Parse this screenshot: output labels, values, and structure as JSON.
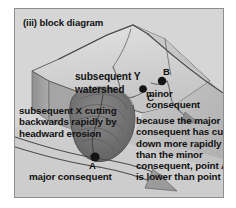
{
  "figure": {
    "title": "(iii) block diagram",
    "type": "block-diagram"
  },
  "labels": {
    "subsequent_y": "subsequent Y",
    "watershed": "watershed",
    "subsequent_x": "subsequent X cutting\nbackwards rapidly by\nheadward erosion",
    "minor_consequent": "minor\nconsequent",
    "major_consequent": "major consequent",
    "explanation": "because the major\nconsequent has cut\ndown more rapidly\nthan the minor\nconsequent, point A\nis lower than point B"
  },
  "points": {
    "a": "A",
    "b": "B",
    "c": "C"
  },
  "colors": {
    "panel_background": "#d6d6d6",
    "panel_border": "#8e8e8e",
    "page_background": "#ffffff",
    "block_top": "#d2d2d2",
    "block_side": "#9a9a9a",
    "valley_dark": "#6f6f6f",
    "stream_line": "#4a4a4a",
    "text": "#111111"
  }
}
